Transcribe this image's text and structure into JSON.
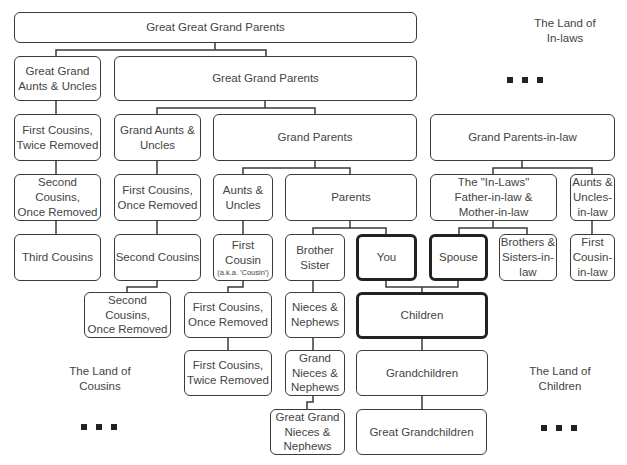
{
  "diagram": {
    "nodes": {
      "ggg_parents": "Great Great Grand Parents",
      "gg_aunts": "Great Grand\nAunts & Uncles",
      "gg_parents": "Great Grand Parents",
      "first_cousins_twice_a": "First Cousins,\nTwice Removed",
      "grand_aunts": "Grand Aunts &\nUncles",
      "grand_parents": "Grand Parents",
      "grand_parents_in_law": "Grand Parents-in-law",
      "second_cousins_once_a": "Second Cousins,\nOnce Removed",
      "first_cousins_once_a": "First Cousins,\nOnce Removed",
      "aunts_uncles": "Aunts &\nUncles",
      "parents": "Parents",
      "in_laws": "The \"In-Laws\"\nFather-in-law &\nMother-in-law",
      "aunts_uncles_in_law": "Aunts &\nUncles-\nin-law",
      "third_cousins": "Third Cousins",
      "second_cousins": "Second Cousins",
      "first_cousin": "First\nCousin",
      "first_cousin_note": "(a.k.a. 'Cousin')",
      "brother_sister": "Brother\nSister",
      "you": "You",
      "spouse": "Spouse",
      "brothers_sisters_in_law": "Brothers &\nSisters-in-\nlaw",
      "first_cousin_in_law": "First\nCousin-\nin-law",
      "second_cousins_once_b": "Second Cousins,\nOnce Removed",
      "first_cousins_once_b": "First Cousins,\nOnce Removed",
      "nieces_nephews": "Nieces &\nNephews",
      "children": "Children",
      "first_cousins_twice_b": "First Cousins,\nTwice Removed",
      "grand_nieces": "Grand\nNieces &\nNephews",
      "grandchildren": "Grandchildren",
      "great_grand_nieces": "Great Grand\nNieces &\nNephews",
      "great_grandchildren": "Great Grandchildren"
    },
    "regions": {
      "in_laws": "The Land of\nIn-laws",
      "cousins": "The Land of\nCousins",
      "children": "The Land of\nChildren"
    },
    "ellipsis_icon": "■ ■ ■"
  }
}
